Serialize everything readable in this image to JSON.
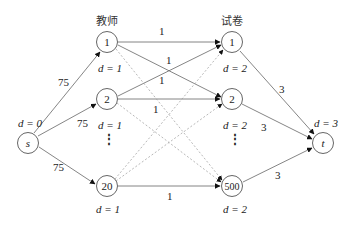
{
  "column_titles": {
    "teachers": "教师",
    "papers": "试卷"
  },
  "nodes": {
    "source": {
      "label": "s",
      "d": "d = 0"
    },
    "sink": {
      "label": "t",
      "d": "d = 3"
    },
    "teachers": [
      {
        "label": "1",
        "d": "d = 1"
      },
      {
        "label": "2",
        "d": "d = 1"
      },
      {
        "label": "20",
        "d": "d = 1"
      }
    ],
    "papers": [
      {
        "label": "1",
        "d": "d = 2"
      },
      {
        "label": "2",
        "d": "d = 2"
      },
      {
        "label": "500",
        "d": "d = 2"
      }
    ],
    "ellipsis": "⋮"
  },
  "edges": {
    "source_to_teacher": [
      "75",
      "75",
      "75"
    ],
    "teacher_to_paper": [
      "1",
      "1",
      "1",
      "1",
      "1"
    ],
    "paper_to_sink": [
      "3",
      "3",
      "3"
    ]
  },
  "colors": {
    "line": "#666666",
    "dashed": "#999999",
    "arrow": "#111111",
    "text": "#222222"
  }
}
